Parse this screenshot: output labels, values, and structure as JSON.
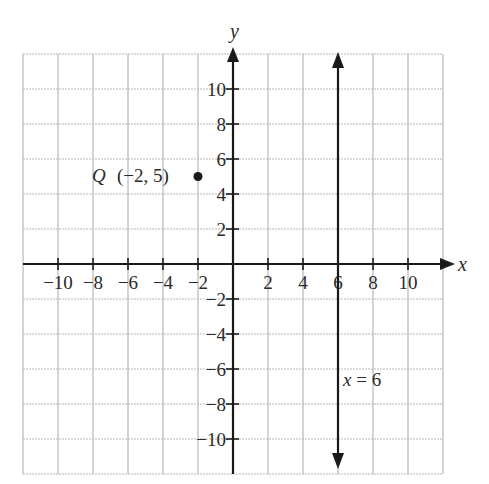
{
  "chart_data": {
    "type": "scatter",
    "title": "",
    "xlabel": "x",
    "ylabel": "y",
    "xlim": [
      -12,
      12
    ],
    "ylim": [
      -12,
      12
    ],
    "grid": true,
    "grid_step": 2,
    "x_ticks": [
      -10,
      -8,
      -6,
      -4,
      -2,
      2,
      4,
      6,
      8,
      10
    ],
    "y_ticks": [
      10,
      8,
      6,
      4,
      2,
      -2,
      -4,
      -6,
      -8,
      -10
    ],
    "x_tick_labels": [
      "−10",
      "−8",
      "−6",
      "−4",
      "−2",
      "2",
      "4",
      "6",
      "8",
      "10"
    ],
    "y_tick_labels": [
      "10",
      "8",
      "6",
      "4",
      "2",
      "−2",
      "−4",
      "−6",
      "−8",
      "−10"
    ],
    "points": [
      {
        "name": "Q",
        "x": -2,
        "y": 5,
        "label": "Q (−2, 5)"
      }
    ],
    "lines": [
      {
        "type": "vertical",
        "x": 6,
        "label": "x = 6",
        "arrows": "both"
      }
    ]
  },
  "labels": {
    "x_axis": "x",
    "y_axis": "y",
    "point_q_name": "Q",
    "point_q_coords": "(−2, 5)",
    "line_eq": "x = 6"
  },
  "colors": {
    "grid": "#b8b8b8",
    "axis": "#1a1a1a",
    "text": "#2a2a2a"
  }
}
